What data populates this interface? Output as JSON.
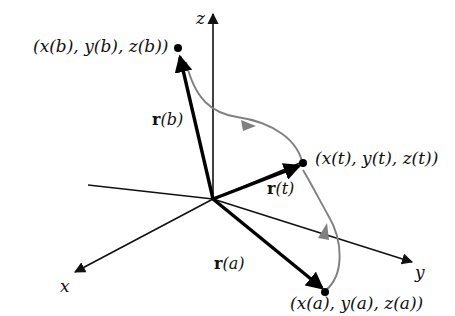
{
  "figure": {
    "background_color": "#ffffff",
    "width": 455,
    "height": 316
  },
  "colors": {
    "axis": "#111111",
    "vector": "#000000",
    "curve": "#808080",
    "point": "#000000",
    "text": "#111111"
  },
  "axes": [
    {
      "name": "z-axis",
      "label": "z",
      "direction": "up"
    },
    {
      "name": "y-axis",
      "label": "y",
      "direction": "down-right"
    },
    {
      "name": "x-axis",
      "label": "x",
      "direction": "down-left"
    }
  ],
  "points": [
    {
      "name": "point-b",
      "label": "(x(b), y(b), z(b))",
      "parameter": "b"
    },
    {
      "name": "point-t",
      "label": "(x(t), y(t), z(t))",
      "parameter": "t"
    },
    {
      "name": "point-a",
      "label": "(x(a), y(a), z(a))",
      "parameter": "a"
    }
  ],
  "vectors": [
    {
      "name": "vector-r-b",
      "bold": "r",
      "arg": "(b)"
    },
    {
      "name": "vector-r-t",
      "bold": "r",
      "arg": "(t)"
    },
    {
      "name": "vector-r-a",
      "bold": "r",
      "arg": "(a)"
    }
  ],
  "curve": {
    "name": "space-curve",
    "color": "#808080",
    "direction": "from a through t to b"
  }
}
